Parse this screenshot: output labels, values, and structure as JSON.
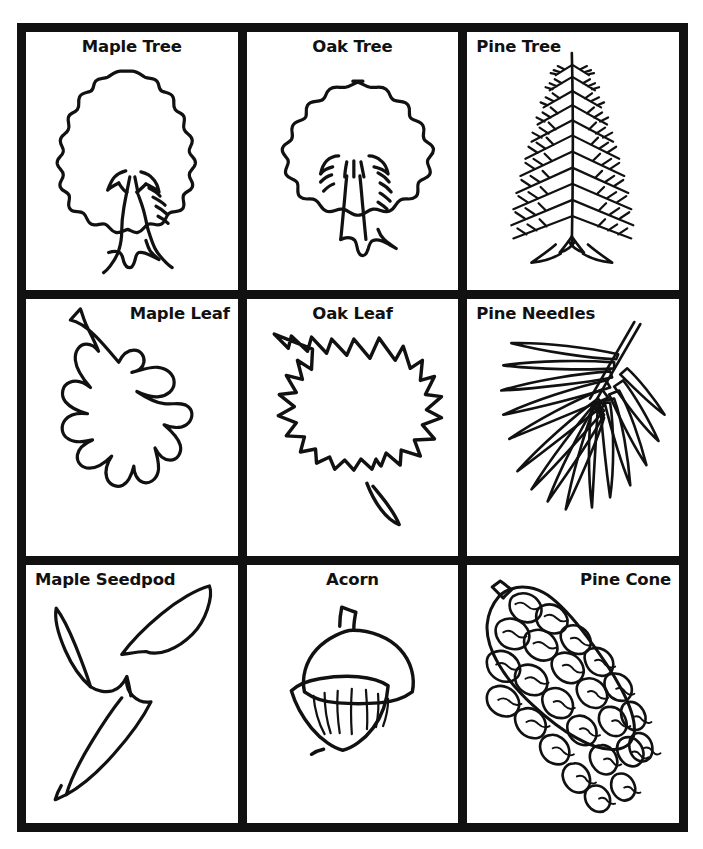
{
  "page": {
    "type": "worksheet-flashcard-sheet",
    "background_color": "#ffffff",
    "ink_color": "#111111",
    "grid": {
      "rows": 3,
      "columns": 3,
      "border_width_px": 9,
      "gutter_px": 9
    }
  },
  "cells": [
    {
      "label": "Maple Tree",
      "icon": "maple-tree-icon",
      "label_align": "center",
      "row": 1,
      "col": 1
    },
    {
      "label": "Oak Tree",
      "icon": "oak-tree-icon",
      "label_align": "center",
      "row": 1,
      "col": 2
    },
    {
      "label": "Pine Tree",
      "icon": "pine-tree-icon",
      "label_align": "left",
      "row": 1,
      "col": 3
    },
    {
      "label": "Maple Leaf",
      "icon": "maple-leaf-icon",
      "label_align": "right",
      "row": 2,
      "col": 1
    },
    {
      "label": "Oak Leaf",
      "icon": "oak-leaf-icon",
      "label_align": "center",
      "row": 2,
      "col": 2
    },
    {
      "label": "Pine Needles",
      "icon": "pine-needles-icon",
      "label_align": "left",
      "row": 2,
      "col": 3
    },
    {
      "label": "Maple Seedpod",
      "icon": "maple-seedpod-icon",
      "label_align": "left",
      "row": 3,
      "col": 1
    },
    {
      "label": "Acorn",
      "icon": "acorn-icon",
      "label_align": "center",
      "row": 3,
      "col": 2
    },
    {
      "label": "Pine Cone",
      "icon": "pine-cone-icon",
      "label_align": "right",
      "row": 3,
      "col": 3
    }
  ]
}
